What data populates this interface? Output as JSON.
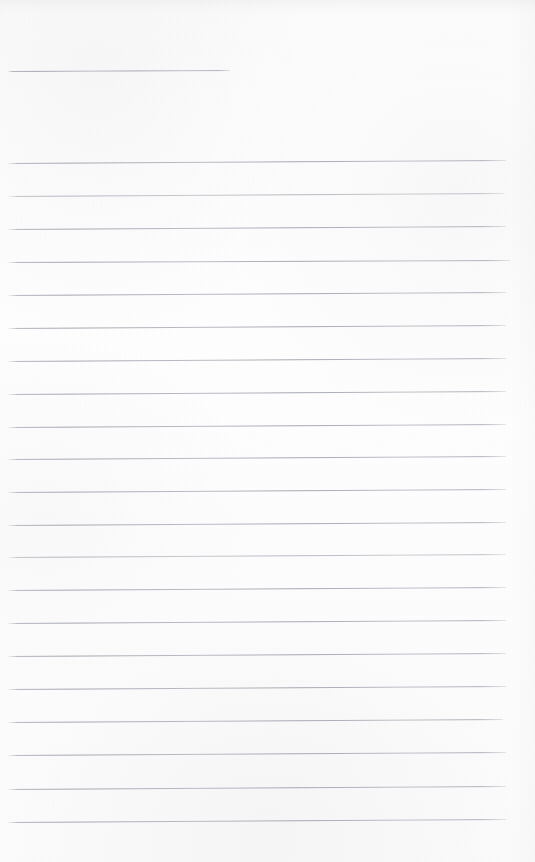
{
  "document": {
    "kind": "ruled-notebook-page",
    "title": "Blank lined notebook page",
    "page_width": 535,
    "page_height": 862,
    "paper_color": "#fdfdfd",
    "rule_color": "#a8acb4",
    "rule_thickness_px": 1,
    "rule_spacing_px": 33,
    "content_text": "",
    "handwriting_present": "no",
    "printed_text_present": "no",
    "margin_rule_present": "no",
    "rule_count_total": 22,
    "rule_count_full_width": 21,
    "rule_count_partial_width": 1
  },
  "rules": [
    {
      "index": 1,
      "y": 71,
      "x_start": 8,
      "x_end": 230,
      "tilt_px": -1,
      "width_kind": "partial",
      "opacity": "normal"
    },
    {
      "index": 2,
      "y": 163,
      "x_start": 8,
      "x_end": 506,
      "tilt_px": -3,
      "width_kind": "full",
      "opacity": "normal"
    },
    {
      "index": 3,
      "y": 196,
      "x_start": 8,
      "x_end": 504,
      "tilt_px": -3,
      "width_kind": "full",
      "opacity": "faint"
    },
    {
      "index": 4,
      "y": 229,
      "x_start": 8,
      "x_end": 506,
      "tilt_px": -3,
      "width_kind": "full",
      "opacity": "normal"
    },
    {
      "index": 5,
      "y": 262,
      "x_start": 8,
      "x_end": 510,
      "tilt_px": -2,
      "width_kind": "full",
      "opacity": "normal"
    },
    {
      "index": 6,
      "y": 295,
      "x_start": 8,
      "x_end": 506,
      "tilt_px": -3,
      "width_kind": "full",
      "opacity": "normal"
    },
    {
      "index": 7,
      "y": 328,
      "x_start": 8,
      "x_end": 506,
      "tilt_px": -3,
      "width_kind": "full",
      "opacity": "normal"
    },
    {
      "index": 8,
      "y": 361,
      "x_start": 8,
      "x_end": 506,
      "tilt_px": -3,
      "width_kind": "full",
      "opacity": "normal"
    },
    {
      "index": 9,
      "y": 394,
      "x_start": 8,
      "x_end": 506,
      "tilt_px": -3,
      "width_kind": "full",
      "opacity": "normal"
    },
    {
      "index": 10,
      "y": 427,
      "x_start": 8,
      "x_end": 506,
      "tilt_px": -3,
      "width_kind": "full",
      "opacity": "normal"
    },
    {
      "index": 11,
      "y": 459,
      "x_start": 8,
      "x_end": 506,
      "tilt_px": -3,
      "width_kind": "full",
      "opacity": "normal"
    },
    {
      "index": 12,
      "y": 492,
      "x_start": 8,
      "x_end": 506,
      "tilt_px": -3,
      "width_kind": "full",
      "opacity": "normal"
    },
    {
      "index": 13,
      "y": 525,
      "x_start": 8,
      "x_end": 506,
      "tilt_px": -3,
      "width_kind": "full",
      "opacity": "normal"
    },
    {
      "index": 14,
      "y": 557,
      "x_start": 8,
      "x_end": 506,
      "tilt_px": -3,
      "width_kind": "full",
      "opacity": "faint"
    },
    {
      "index": 15,
      "y": 590,
      "x_start": 8,
      "x_end": 506,
      "tilt_px": -3,
      "width_kind": "full",
      "opacity": "normal"
    },
    {
      "index": 16,
      "y": 623,
      "x_start": 8,
      "x_end": 506,
      "tilt_px": -3,
      "width_kind": "full",
      "opacity": "normal"
    },
    {
      "index": 17,
      "y": 656,
      "x_start": 8,
      "x_end": 506,
      "tilt_px": -3,
      "width_kind": "full",
      "opacity": "normal"
    },
    {
      "index": 18,
      "y": 689,
      "x_start": 8,
      "x_end": 506,
      "tilt_px": -3,
      "width_kind": "full",
      "opacity": "normal"
    },
    {
      "index": 19,
      "y": 722,
      "x_start": 8,
      "x_end": 503,
      "tilt_px": -3,
      "width_kind": "full",
      "opacity": "normal"
    },
    {
      "index": 20,
      "y": 755,
      "x_start": 8,
      "x_end": 506,
      "tilt_px": -3,
      "width_kind": "full",
      "opacity": "normal"
    },
    {
      "index": 21,
      "y": 789,
      "x_start": 8,
      "x_end": 506,
      "tilt_px": -3,
      "width_kind": "full",
      "opacity": "normal"
    },
    {
      "index": 22,
      "y": 822,
      "x_start": 8,
      "x_end": 506,
      "tilt_px": -3,
      "width_kind": "full",
      "opacity": "normal"
    }
  ]
}
